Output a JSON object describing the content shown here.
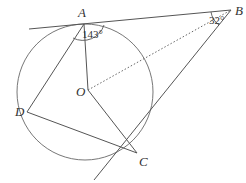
{
  "diagram": {
    "points": {
      "A": {
        "label": "A",
        "x": 84,
        "y": 24
      },
      "B": {
        "label": "B",
        "x": 231,
        "y": 10
      },
      "C": {
        "label": "C",
        "x": 137,
        "y": 153
      },
      "D": {
        "label": "D",
        "x": 27,
        "y": 112
      },
      "O": {
        "label": "O",
        "x": 88,
        "y": 90
      }
    },
    "circle": {
      "center": "O",
      "cx": 85,
      "cy": 92,
      "r": 68
    },
    "angles": {
      "DAO": {
        "label": "143°",
        "at": "A"
      },
      "ABC": {
        "label": "32°",
        "at": "B"
      }
    },
    "segments": [
      {
        "from": "tangent-left",
        "to": "B",
        "type": "tangent",
        "through": "A"
      },
      {
        "from": "B",
        "to": "tangent-lower",
        "type": "tangent",
        "through": "C"
      },
      {
        "from": "A",
        "to": "O",
        "type": "radius"
      },
      {
        "from": "O",
        "to": "C",
        "type": "radius"
      },
      {
        "from": "O",
        "to": "B",
        "type": "dotted"
      },
      {
        "from": "A",
        "to": "D",
        "type": "chord"
      },
      {
        "from": "D",
        "to": "C",
        "type": "chord"
      }
    ],
    "colors": {
      "line": "#555555",
      "circle": "#777777",
      "text": "#333333"
    }
  }
}
